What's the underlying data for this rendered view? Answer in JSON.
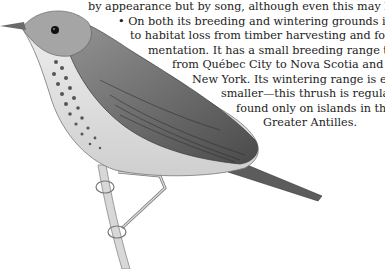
{
  "article": {
    "lines": [
      "by appearance but by song, although even this may be challenging.",
      "• On both its breeding and wintering grounds it is vulnerable",
      "to habitat loss from timber harvesting and forest frag-",
      "mentation. It has a small breeding range that extends",
      "from Québec City to Nova Scotia and south to",
      "New York. Its wintering range is even",
      "smaller—this thrush is regularly",
      "found only on islands in the",
      "Greater Antilles."
    ]
  },
  "illustration": {
    "subject": "thrush perched on branch",
    "style": "grayscale pencil drawing"
  }
}
